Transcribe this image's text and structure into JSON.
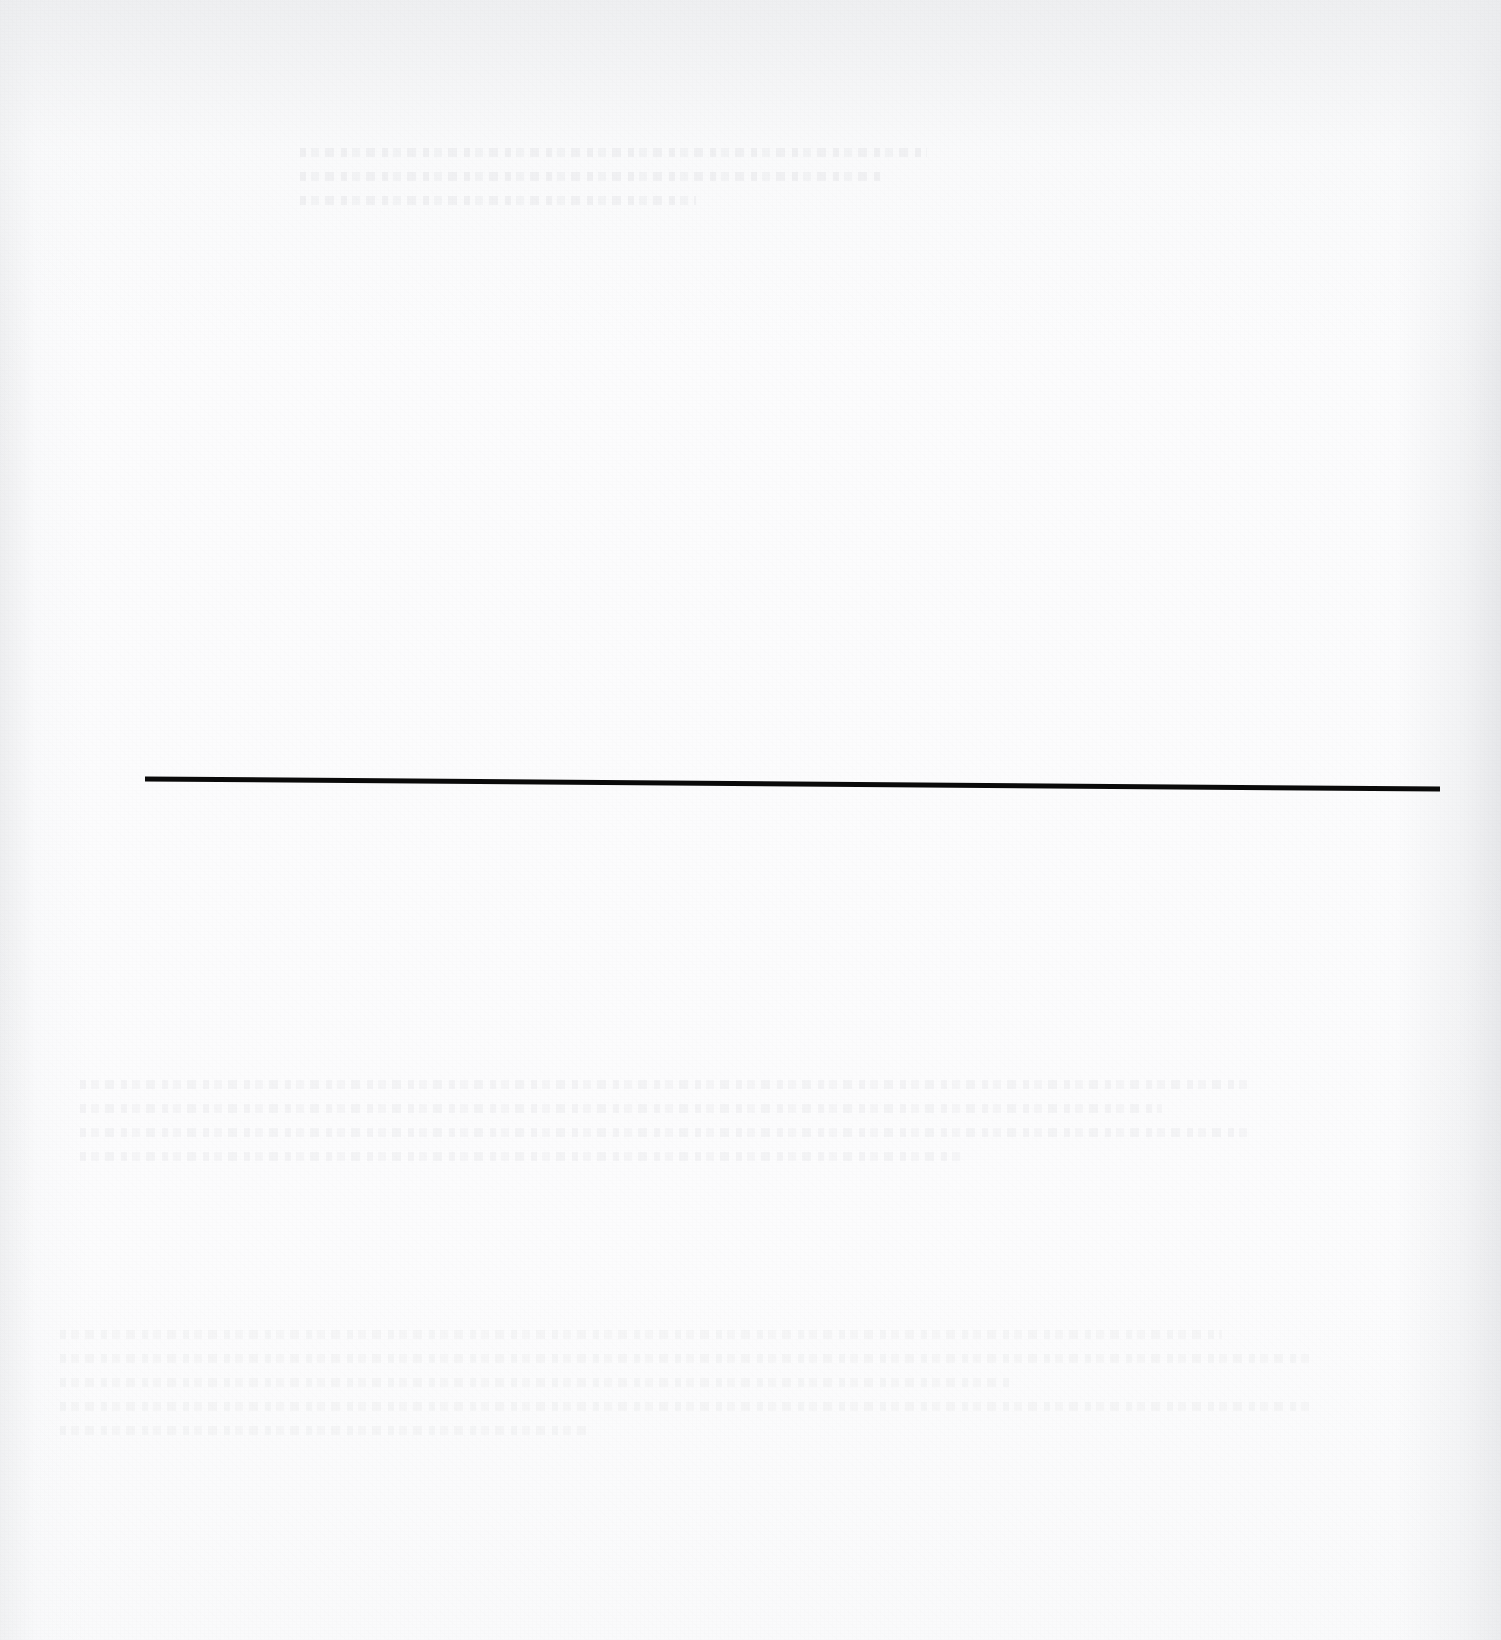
{
  "page": {
    "label": "scanned-blank-page",
    "width": 1501,
    "height": 1640,
    "background_color": "#fcfcfd",
    "paper_tone_color": "#f3f4f6",
    "visible_text": ""
  },
  "rule": {
    "label": "horizontal-rule",
    "color": "#0a0a0a",
    "x_start": 145,
    "y_start": 779,
    "x_end": 1440,
    "y_end": 789,
    "thickness": 5,
    "length": 1295
  },
  "artifacts": {
    "bleed_through_label": "faint verso show-through, illegible",
    "grain_label": "paper grain texture",
    "vignette_label": "scanner edge shading",
    "regions": [
      {
        "name": "ghost-text-top",
        "x": 300,
        "y": 148,
        "width": 660,
        "height": 80
      },
      {
        "name": "ghost-text-middle",
        "x": 80,
        "y": 1080,
        "width": 1230,
        "height": 130
      },
      {
        "name": "ghost-text-bottom",
        "x": 60,
        "y": 1330,
        "width": 1320,
        "height": 190
      }
    ]
  }
}
